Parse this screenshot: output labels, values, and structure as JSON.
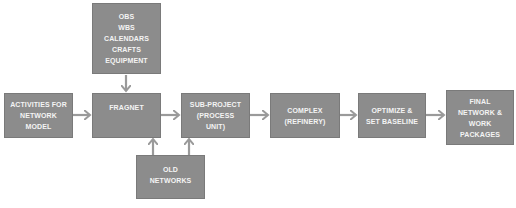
{
  "diagram": {
    "type": "flowchart",
    "colors": {
      "box_fill": "#8c8c8c",
      "box_text": "#f4f4f4",
      "arrow": "#9a9a9a",
      "background": "#ffffff"
    },
    "nodes": {
      "resources": {
        "lines": [
          "OBS",
          "WBS",
          "CALENDARS",
          "CRAFTS",
          "EQUIPMENT"
        ]
      },
      "activities": {
        "lines": [
          "ACTIVITIES FOR",
          "NETWORK",
          "MODEL"
        ]
      },
      "fragnet": {
        "lines": [
          "FRAGNET"
        ]
      },
      "subproject": {
        "lines": [
          "SUB-PROJECT",
          "(PROCESS",
          "UNIT)"
        ]
      },
      "old_networks": {
        "lines": [
          "OLD",
          "NETWORKS"
        ]
      },
      "complex": {
        "lines": [
          "COMPLEX",
          "(REFINERY)"
        ]
      },
      "optimize": {
        "lines": [
          "OPTIMIZE &",
          "SET BASELINE"
        ]
      },
      "final": {
        "lines": [
          "FINAL",
          "NETWORK &",
          "WORK",
          "PACKAGES"
        ]
      }
    },
    "edges": [
      {
        "from": "resources",
        "to": "fragnet"
      },
      {
        "from": "activities",
        "to": "fragnet"
      },
      {
        "from": "fragnet",
        "to": "subproject"
      },
      {
        "from": "old_networks",
        "to": "fragnet"
      },
      {
        "from": "old_networks",
        "to": "subproject"
      },
      {
        "from": "subproject",
        "to": "complex"
      },
      {
        "from": "complex",
        "to": "optimize"
      },
      {
        "from": "optimize",
        "to": "final"
      }
    ]
  }
}
